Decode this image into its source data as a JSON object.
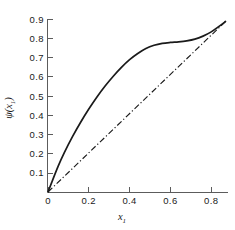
{
  "chart_data": {
    "type": "line",
    "title": "",
    "subtitle": "",
    "xlabel": "x",
    "xlabel_sub": "1",
    "ylabel": "ψ(x",
    "ylabel_sub": "1",
    "ylabel_close": ")",
    "xlabel_full": "x₁",
    "ylabel_full": "ψ(x₁)",
    "xlim": [
      0,
      0.93
    ],
    "ylim": [
      0,
      0.93
    ],
    "xticks": [
      0,
      0.2,
      0.4,
      0.6,
      0.8
    ],
    "xticklabels": [
      "0",
      "0.2",
      "0.4",
      "0.6",
      "0.8"
    ],
    "yticks": [
      0.1,
      0.2,
      0.3,
      0.4,
      0.5,
      0.6,
      0.7,
      0.8,
      0.9
    ],
    "yticklabels": [
      "0.1",
      "0.2",
      "0.3",
      "0.4",
      "0.5",
      "0.6",
      "0.7",
      "0.8",
      "0.9"
    ],
    "grid": false,
    "legend": false,
    "legend_position": "none",
    "background_color": "#ffffff",
    "axis_color": "#4a4a4a",
    "series": [
      {
        "name": "psi-curve",
        "style": "solid",
        "color": "#1a1a1a",
        "x": [
          0.0,
          0.02,
          0.05,
          0.08,
          0.12,
          0.16,
          0.2,
          0.24,
          0.28,
          0.32,
          0.36,
          0.4,
          0.44,
          0.48,
          0.52,
          0.56,
          0.6,
          0.64,
          0.68,
          0.72,
          0.76,
          0.8,
          0.84,
          0.87
        ],
        "y": [
          0.0,
          0.055,
          0.135,
          0.205,
          0.288,
          0.363,
          0.432,
          0.495,
          0.552,
          0.603,
          0.649,
          0.689,
          0.721,
          0.747,
          0.764,
          0.774,
          0.779,
          0.782,
          0.787,
          0.796,
          0.812,
          0.834,
          0.864,
          0.888
        ]
      },
      {
        "name": "diagonal-reference",
        "style": "dash-dot",
        "color": "#1a1a1a",
        "x": [
          0.0,
          0.87
        ],
        "y": [
          0.0,
          0.888
        ]
      }
    ]
  }
}
